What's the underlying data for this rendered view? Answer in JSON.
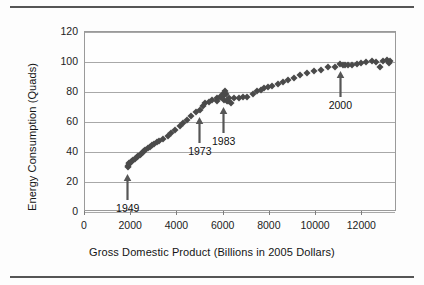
{
  "chart_data": {
    "type": "scatter",
    "title": "",
    "xlabel": "Gross Domestic Product (Billions in 2005 Dollars)",
    "ylabel": "Energy Consumption (Quads)",
    "xlim": [
      0,
      13500
    ],
    "ylim": [
      0,
      120
    ],
    "xticks": [
      0,
      2000,
      4000,
      6000,
      8000,
      10000,
      12000
    ],
    "xtick_labels": [
      "0",
      "2000",
      "4000",
      "6000",
      "8000",
      "10000",
      "12000"
    ],
    "yticks": [
      0,
      20,
      40,
      60,
      80,
      100,
      120
    ],
    "ytick_labels": [
      "0",
      "20",
      "40",
      "60",
      "80",
      "100",
      "120"
    ],
    "grid": true,
    "legend": false,
    "marker": "diamond",
    "marker_color": "#4a4a4a",
    "series": [
      {
        "name": "US Energy Consumption vs GDP",
        "points": [
          [
            1850,
            30.0
          ],
          [
            1880,
            31.0
          ],
          [
            1920,
            32.0
          ],
          [
            1900,
            32.5
          ],
          [
            1980,
            33.5
          ],
          [
            2030,
            34.0
          ],
          [
            2080,
            34.8
          ],
          [
            2150,
            35.5
          ],
          [
            2230,
            36.5
          ],
          [
            2280,
            37.5
          ],
          [
            2380,
            38.3
          ],
          [
            2420,
            39.0
          ],
          [
            2500,
            40.0
          ],
          [
            2560,
            41.0
          ],
          [
            2600,
            41.5
          ],
          [
            2720,
            42.5
          ],
          [
            2800,
            43.5
          ],
          [
            2900,
            44.5
          ],
          [
            2980,
            45.5
          ],
          [
            3100,
            46.5
          ],
          [
            3200,
            47.5
          ],
          [
            3380,
            49.0
          ],
          [
            3580,
            51.0
          ],
          [
            3720,
            53.0
          ],
          [
            3900,
            55.0
          ],
          [
            4100,
            57.5
          ],
          [
            4250,
            59.5
          ],
          [
            4400,
            61.5
          ],
          [
            4600,
            64.0
          ],
          [
            4820,
            66.5
          ],
          [
            4970,
            68.0
          ],
          [
            5100,
            71.0
          ],
          [
            5200,
            72.5
          ],
          [
            5380,
            73.5
          ],
          [
            5500,
            74.5
          ],
          [
            5720,
            76.0
          ],
          [
            5700,
            74.0
          ],
          [
            5850,
            76.5
          ],
          [
            6020,
            78.0
          ],
          [
            6100,
            79.0
          ],
          [
            6050,
            80.5
          ],
          [
            5950,
            78.5
          ],
          [
            5880,
            76.5
          ],
          [
            6000,
            74.5
          ],
          [
            6150,
            73.8
          ],
          [
            6300,
            73.0
          ],
          [
            6200,
            74.2
          ],
          [
            6250,
            76.0
          ],
          [
            6450,
            76.0
          ],
          [
            6650,
            76.2
          ],
          [
            6850,
            76.5
          ],
          [
            7000,
            76.8
          ],
          [
            7250,
            79.0
          ],
          [
            7450,
            80.5
          ],
          [
            7600,
            81.5
          ],
          [
            7750,
            82.5
          ],
          [
            7900,
            83.5
          ],
          [
            8100,
            84.0
          ],
          [
            8350,
            85.5
          ],
          [
            8550,
            87.0
          ],
          [
            8800,
            88.0
          ],
          [
            9050,
            89.5
          ],
          [
            9300,
            91.5
          ],
          [
            9600,
            92.5
          ],
          [
            9900,
            94.0
          ],
          [
            10200,
            95.0
          ],
          [
            10500,
            96.5
          ],
          [
            10800,
            97.0
          ],
          [
            11050,
            98.5
          ],
          [
            11150,
            98.0
          ],
          [
            11250,
            98.0
          ],
          [
            11400,
            97.8
          ],
          [
            11550,
            98.2
          ],
          [
            11750,
            98.5
          ],
          [
            11950,
            99.5
          ],
          [
            12150,
            100.0
          ],
          [
            12400,
            100.5
          ],
          [
            12600,
            100.2
          ],
          [
            12750,
            96.5
          ],
          [
            12900,
            100.5
          ],
          [
            13050,
            101.5
          ],
          [
            13150,
            99.5
          ],
          [
            13200,
            101.0
          ]
        ]
      }
    ],
    "annotations": [
      {
        "label": "1949",
        "x": 1850,
        "y": 30.0,
        "label_offset_y": -19
      },
      {
        "label": "1973",
        "x": 4970,
        "y": 68.0,
        "label_offset_y": -19
      },
      {
        "label": "1983",
        "x": 6000,
        "y": 74.5,
        "label_offset_y": -19
      },
      {
        "label": "2000",
        "x": 11050,
        "y": 98.5,
        "label_offset_y": -19
      }
    ]
  }
}
